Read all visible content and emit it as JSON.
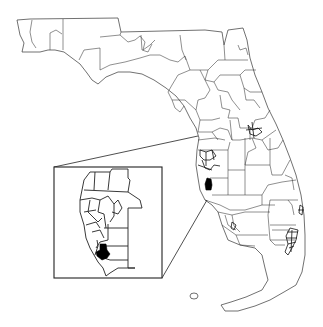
{
  "map": {
    "subject": "Florida",
    "type": "district boundary map",
    "style": "monochrome line map",
    "colors": {
      "background": "#ffffff",
      "boundary": "#333333",
      "highlight": "#000000"
    },
    "highlighted_district": {
      "location": "Gulf coast, Sarasota area",
      "fill": "#000000"
    },
    "dense_clusters": [
      "Tampa Bay area",
      "Orlando area",
      "Palm Beach County",
      "Broward / Miami-Dade"
    ],
    "inset": {
      "description": "Enlarged view of Tampa Bay to Sarasota region",
      "position": "lower-left",
      "highlighted_district_shown": true
    },
    "text_labels": []
  }
}
